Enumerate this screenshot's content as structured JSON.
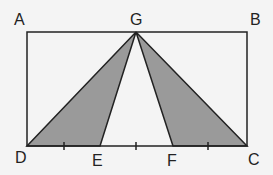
{
  "diagram": {
    "colors": {
      "stroke": "#222222",
      "fill": "#9a9a9a",
      "background": "#f4f4f4"
    },
    "points": {
      "A": {
        "label": "A",
        "x": 27,
        "y": 32
      },
      "B": {
        "label": "B",
        "x": 247,
        "y": 32
      },
      "C": {
        "label": "C",
        "x": 247,
        "y": 146
      },
      "D": {
        "label": "D",
        "x": 27,
        "y": 146
      },
      "E": {
        "label": "E",
        "x": 100,
        "y": 146
      },
      "F": {
        "label": "F",
        "x": 173,
        "y": 146
      },
      "G": {
        "label": "G",
        "x": 136,
        "y": 32
      }
    },
    "shaded_triangles": [
      [
        "G",
        "D",
        "E"
      ],
      [
        "G",
        "F",
        "C"
      ]
    ],
    "tick_marks_x": [
      64,
      136,
      208
    ]
  }
}
